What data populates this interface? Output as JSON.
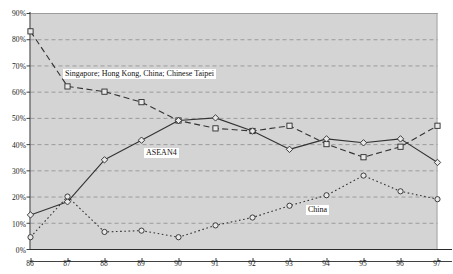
{
  "chart_data": {
    "type": "line",
    "title": "",
    "subtitle": "",
    "xlabel": "",
    "ylabel": "",
    "x": [
      "86",
      "87",
      "88",
      "89",
      "90",
      "91",
      "92",
      "93",
      "94",
      "95",
      "96",
      "97"
    ],
    "xlim": [
      86,
      97
    ],
    "ylim": [
      0,
      90
    ],
    "y_ticks": [
      "0%",
      "10%",
      "20%",
      "30%",
      "40%",
      "50%",
      "60%",
      "70%",
      "80%",
      "90%"
    ],
    "y_tick_values": [
      0,
      10,
      20,
      30,
      40,
      50,
      60,
      70,
      80,
      90
    ],
    "grid": true,
    "grid_axis": "y",
    "legend": "inline-annotations",
    "plot_background": "#d4d4d4",
    "series": [
      {
        "name": "Singapore; Hong Kong, China; Chinese Taipei",
        "style": "dashed",
        "marker": "square",
        "color": "#333333",
        "values": [
          83,
          62,
          60,
          56,
          49,
          46,
          45,
          47,
          40,
          35,
          39,
          47
        ]
      },
      {
        "name": "ASEAN4",
        "style": "solid",
        "marker": "diamond",
        "color": "#333333",
        "values": [
          13,
          18,
          34,
          41.5,
          49,
          50,
          45,
          38,
          42,
          40.5,
          42,
          33
        ]
      },
      {
        "name": "China",
        "style": "dotted",
        "marker": "circle",
        "color": "#333333",
        "values": [
          4.5,
          20,
          6.5,
          7,
          4.5,
          9,
          12,
          16.5,
          20.5,
          28,
          22,
          19
        ]
      }
    ],
    "annotations": [
      {
        "text": "Singapore; Hong Kong, China; Chinese Taipei",
        "x": 87.05,
        "y": 65.5
      },
      {
        "text": "ASEAN4",
        "x": 88.95,
        "y": 33.5
      },
      {
        "text": "China",
        "x": 93.35,
        "y": 15.0
      }
    ]
  }
}
